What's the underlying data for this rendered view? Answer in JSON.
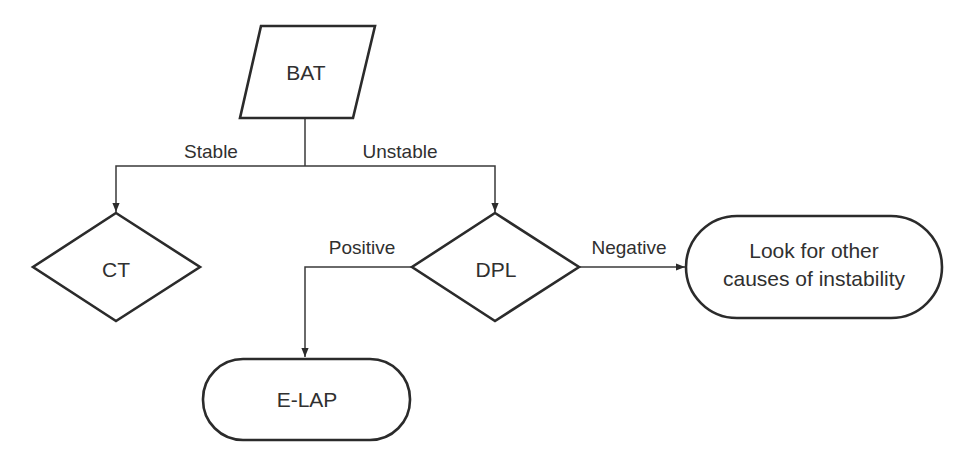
{
  "diagram": {
    "type": "flowchart",
    "colors": {
      "background": "#ffffff",
      "stroke": "#2b2b2b",
      "text": "#303030"
    },
    "nodes": {
      "bat": {
        "label": "BAT",
        "shape": "parallelogram"
      },
      "ct": {
        "label": "CT",
        "shape": "diamond"
      },
      "dpl": {
        "label": "DPL",
        "shape": "diamond"
      },
      "elap": {
        "label": "E-LAP",
        "shape": "terminal"
      },
      "other": {
        "label_line1": "Look for other",
        "label_line2": "causes of instability",
        "shape": "terminal"
      }
    },
    "edges": {
      "stable": {
        "from": "BAT",
        "to": "CT",
        "label": "Stable"
      },
      "unstable": {
        "from": "BAT",
        "to": "DPL",
        "label": "Unstable"
      },
      "positive": {
        "from": "DPL",
        "to": "E-LAP",
        "label": "Positive"
      },
      "negative": {
        "from": "DPL",
        "to": "Look for other causes of instability",
        "label": "Negative"
      }
    }
  }
}
